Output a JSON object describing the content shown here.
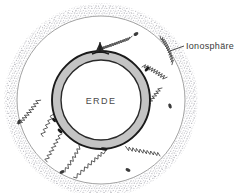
{
  "figure": {
    "type": "schematic-diagram",
    "background_color": "#ffffff"
  },
  "labels": {
    "ionosphere": "Ionosphäre",
    "earth": "ERDE"
  },
  "colors": {
    "earth_crust_fill": "#c4c4c4",
    "earth_outline": "#1a1a1a",
    "earth_interior_fill": "#ffffff",
    "ionosphere_stipple": "#9a9aa2",
    "inner_boundary_line": "#7a7a7a",
    "wave_path": "#4a4a4a",
    "label_color": "#3a3a3a",
    "leader_line": "#4a4a4a"
  },
  "geometry": {
    "center_x": 101,
    "center_y": 100,
    "earth_outer_radius": 49,
    "earth_inner_radius": 40,
    "inner_boundary_radius": 84,
    "ionosphere_radius": 95,
    "ionosphere_band_width": 9
  },
  "elements": {
    "antenna_label": "transmitter-antenna",
    "wave_count": 4,
    "reflection_points": 4
  }
}
